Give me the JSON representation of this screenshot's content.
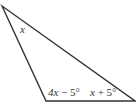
{
  "figure": {
    "type": "triangle",
    "stroke_color": "#333333",
    "background": "#ffffff",
    "vertices": {
      "top": [
        2,
        6
      ],
      "bottom_left": [
        46,
        101
      ],
      "bottom_right": [
        135,
        101
      ]
    },
    "angles": {
      "top": {
        "label": "x"
      },
      "bottom_left": {
        "label": "4x − 5°",
        "var": "4x",
        "rest": " − 5°"
      },
      "bottom_right": {
        "label": "x + 5°",
        "var": "x",
        "rest": " + 5°"
      }
    }
  }
}
